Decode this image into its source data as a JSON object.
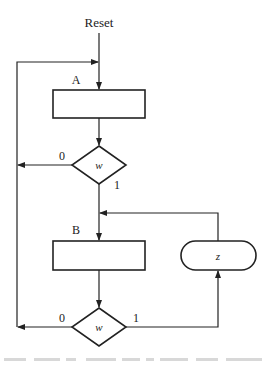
{
  "diagram": {
    "type": "asm-chart",
    "entry_label": "Reset",
    "states": [
      {
        "id": "A",
        "label": "A"
      },
      {
        "id": "B",
        "label": "B"
      }
    ],
    "decisions": [
      {
        "id": "d1",
        "variable": "w",
        "false_label": "0",
        "true_label": "1"
      },
      {
        "id": "d2",
        "variable": "w",
        "false_label": "0",
        "true_label": "1"
      }
    ],
    "conditional_outputs": [
      {
        "id": "o1",
        "label": "z"
      }
    ],
    "colors": {
      "line": "#222222",
      "background": "#ffffff"
    }
  }
}
